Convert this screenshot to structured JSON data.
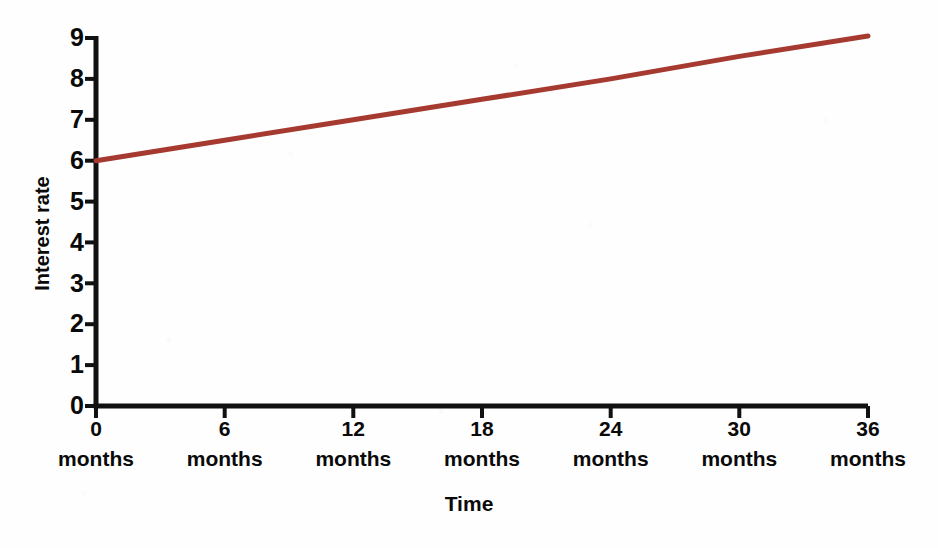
{
  "chart_data": {
    "type": "line",
    "title": "",
    "xlabel": "Time",
    "ylabel": "Interest rate",
    "x": [
      0,
      6,
      12,
      18,
      24,
      30,
      36
    ],
    "xtick_labels": [
      {
        "value": "0",
        "unit": "months"
      },
      {
        "value": "6",
        "unit": "months"
      },
      {
        "value": "12",
        "unit": "months"
      },
      {
        "value": "18",
        "unit": "months"
      },
      {
        "value": "24",
        "unit": "months"
      },
      {
        "value": "30",
        "unit": "months"
      },
      {
        "value": "36",
        "unit": "months"
      }
    ],
    "ytick_labels": [
      "9",
      "8",
      "7",
      "6",
      "5",
      "4",
      "3",
      "2",
      "1",
      "0"
    ],
    "ylim": [
      0,
      9
    ],
    "xlim": [
      0,
      36
    ],
    "grid": false,
    "legend": "none",
    "series": [
      {
        "name": "Interest rate",
        "color": "#a63a30",
        "line_width": 5,
        "values": [
          6.0,
          6.5,
          7.0,
          7.5,
          8.0,
          8.55,
          9.05
        ]
      }
    ],
    "annotations": []
  },
  "style": {
    "axis_color": "#111111",
    "background": "#fefefe",
    "text_color": "#0a0a0a"
  }
}
